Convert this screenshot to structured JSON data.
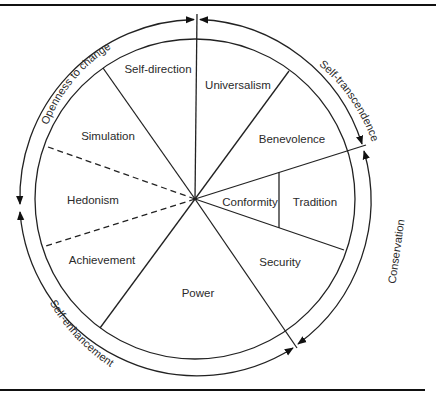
{
  "diagram": {
    "segments": [
      {
        "id": "self-direction",
        "label": "Self-direction",
        "x": 147,
        "y": 72
      },
      {
        "id": "universalism",
        "label": "Universalism",
        "x": 240,
        "y": 86
      },
      {
        "id": "simulation",
        "label": "Simulation",
        "x": 112,
        "y": 140
      },
      {
        "id": "benevolence",
        "label": "Benevolence",
        "x": 290,
        "y": 143
      },
      {
        "id": "hedonism",
        "label": "Hedonism",
        "x": 92,
        "y": 204
      },
      {
        "id": "conformity",
        "label": "Conformity",
        "x": 250,
        "y": 206
      },
      {
        "id": "tradition",
        "label": "Tradition",
        "x": 316,
        "y": 206
      },
      {
        "id": "achievement",
        "label": "Achievement",
        "x": 103,
        "y": 264
      },
      {
        "id": "security",
        "label": "Security",
        "x": 285,
        "y": 266
      },
      {
        "id": "power",
        "label": "Power",
        "x": 198,
        "y": 297
      }
    ],
    "higher_order": [
      {
        "id": "openness-to-change",
        "label": "Openness to change"
      },
      {
        "id": "self-transcendence",
        "label": "Self-transcendence"
      },
      {
        "id": "conservation",
        "label": "Conservation"
      },
      {
        "id": "self-enhancement",
        "label": "Self-enhancement"
      }
    ],
    "colors": {
      "line": "#222222",
      "text": "#2a2a2a",
      "background": "#ffffff"
    }
  }
}
